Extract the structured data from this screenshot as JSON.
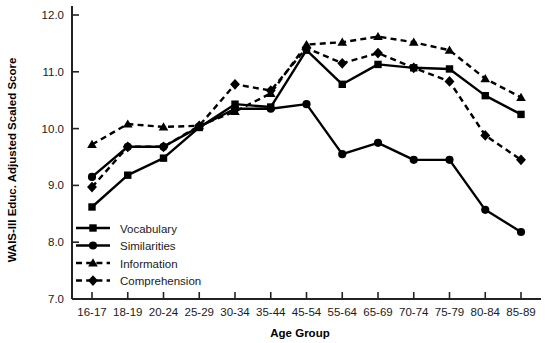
{
  "chart_data": {
    "type": "line",
    "title": "",
    "xlabel": "Age Group",
    "ylabel": "WAIS-III Educ. Adjusted Scaled Score",
    "categories": [
      "16-17",
      "18-19",
      "20-24",
      "25-29",
      "30-34",
      "35-44",
      "45-54",
      "55-64",
      "65-69",
      "70-74",
      "75-79",
      "80-84",
      "85-89"
    ],
    "ylim": [
      7.0,
      12.0
    ],
    "yticks": [
      "7.0",
      "8.0",
      "9.0",
      "10.0",
      "11.0",
      "12.0"
    ],
    "ytick_values": [
      7.0,
      8.0,
      9.0,
      10.0,
      11.0,
      12.0
    ],
    "grid": false,
    "legend_position": "lower-left-inside",
    "series": [
      {
        "name": "Vocabulary",
        "marker": "square",
        "line": "solid",
        "color": "#000000",
        "values": [
          8.62,
          9.18,
          9.48,
          10.02,
          10.43,
          10.38,
          11.38,
          10.78,
          11.13,
          11.07,
          11.05,
          10.58,
          10.25
        ]
      },
      {
        "name": "Similarities",
        "marker": "circle",
        "line": "solid",
        "color": "#000000",
        "values": [
          9.15,
          9.68,
          9.68,
          10.03,
          10.35,
          10.35,
          10.43,
          9.55,
          9.75,
          9.45,
          9.45,
          8.57,
          8.18
        ]
      },
      {
        "name": "Information",
        "marker": "triangle",
        "line": "dashed",
        "color": "#000000",
        "values": [
          9.72,
          10.08,
          10.03,
          10.05,
          10.3,
          10.62,
          11.48,
          11.52,
          11.62,
          11.52,
          11.38,
          10.88,
          10.55
        ]
      },
      {
        "name": "Comprehension",
        "marker": "diamond",
        "line": "dashed",
        "color": "#000000",
        "values": [
          8.97,
          9.68,
          9.68,
          10.05,
          10.78,
          10.67,
          11.42,
          11.15,
          11.33,
          11.07,
          10.83,
          9.88,
          9.45
        ]
      }
    ]
  },
  "legend": {
    "items": [
      {
        "label": "Vocabulary"
      },
      {
        "label": "Similarities"
      },
      {
        "label": "Information"
      },
      {
        "label": "Comprehension"
      }
    ]
  }
}
